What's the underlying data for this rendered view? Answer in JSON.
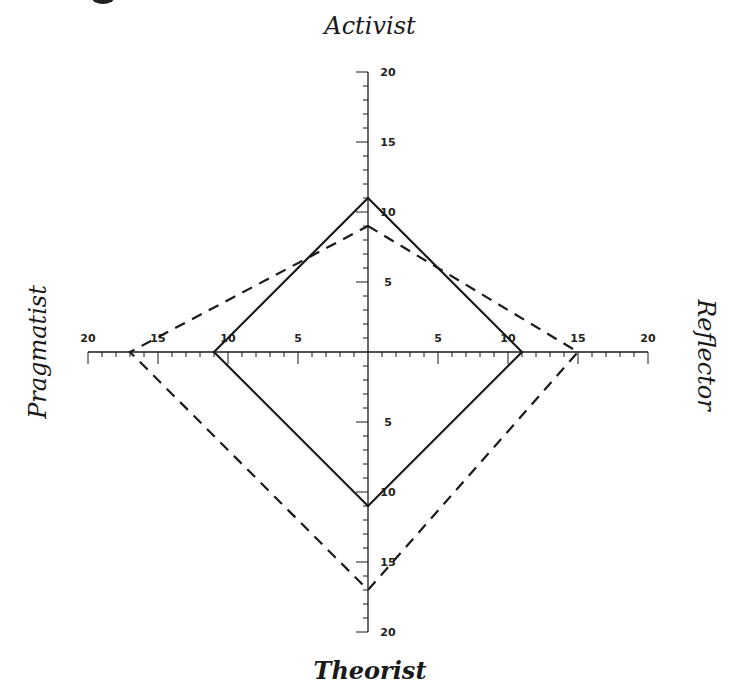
{
  "chart_data": {
    "type": "radar",
    "title": "",
    "axes": [
      "Activist",
      "Reflector",
      "Theorist",
      "Pragmatist"
    ],
    "axis_positions": {
      "Activist": "top",
      "Reflector": "right",
      "Theorist": "bottom",
      "Pragmatist": "left"
    },
    "range": [
      0,
      20
    ],
    "major_ticks": [
      5,
      10,
      15,
      20
    ],
    "minor_tick_step": 1,
    "tick_labels": [
      "5",
      "10",
      "15",
      "20"
    ],
    "grid": false,
    "legend": null,
    "series": [
      {
        "name": "solid",
        "style": "solid",
        "values": {
          "Activist": 11,
          "Reflector": 11,
          "Theorist": 11,
          "Pragmatist": 11
        }
      },
      {
        "name": "dashed",
        "style": "dashed",
        "values": {
          "Activist": 9,
          "Reflector": 15,
          "Theorist": 17,
          "Pragmatist": 17
        }
      }
    ]
  },
  "labels": {
    "top": "Activist",
    "right": "Reflector",
    "bottom": "Theorist",
    "left": "Pragmatist"
  },
  "geometry": {
    "cx": 368,
    "cy": 352,
    "unit": 14
  },
  "colors": {
    "line": "#1a1a1a",
    "background": "#ffffff"
  }
}
